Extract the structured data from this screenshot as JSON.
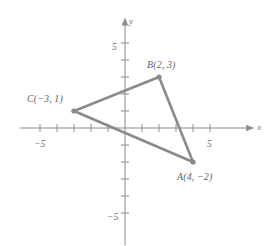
{
  "figure": {
    "width": 268,
    "height": 246,
    "background_color": "#ffffff"
  },
  "axes": {
    "x_axis_label": "x",
    "y_axis_label": "y",
    "axis_color": "#8c8c8c",
    "origin_px": {
      "x": 125,
      "y": 128
    },
    "unit_px": 17,
    "x_tick_labels": [
      {
        "text": "−5",
        "value": -5,
        "px_x": 40,
        "px_y": 140
      },
      {
        "text": "5",
        "value": 5,
        "px_x": 210,
        "px_y": 140
      }
    ],
    "y_tick_labels": [
      {
        "text": "5",
        "value": 5,
        "px_x": 112,
        "px_y": 43
      },
      {
        "text": "−5",
        "value": -5,
        "px_x": 107,
        "px_y": 213
      }
    ],
    "x_ticks": [
      -5,
      -4,
      -3,
      -2,
      -1,
      1,
      2,
      3,
      4,
      5
    ],
    "y_ticks": [
      -5,
      -4,
      -3,
      -2,
      -1,
      1,
      2,
      3,
      4,
      5
    ],
    "grid": false
  },
  "chart_data": {
    "type": "scatter",
    "title": "",
    "xlabel": "x",
    "ylabel": "y",
    "xlim": [
      -6.2,
      7.6
    ],
    "ylim": [
      -6.9,
      6.5
    ],
    "grid": false,
    "legend": null,
    "shape": {
      "name": "triangle ABC",
      "closed": true,
      "stroke_color": "#8a8a8a",
      "stroke_width": 2.6,
      "fill": "none"
    },
    "points": [
      {
        "name": "A",
        "label": "A(4, −2)",
        "x": 4,
        "y": -2,
        "px_x": 193,
        "px_y": 162,
        "label_px_x": 177,
        "label_px_y": 172,
        "marker": "filled-circle",
        "marker_color": "#8a8a8a"
      },
      {
        "name": "B",
        "label": "B(2, 3)",
        "x": 2,
        "y": 3,
        "px_x": 159,
        "px_y": 77,
        "label_px_x": 147,
        "label_px_y": 60,
        "marker": "filled-circle",
        "marker_color": "#8a8a8a"
      },
      {
        "name": "C",
        "label": "C(−3, 1)",
        "x": -3,
        "y": 1,
        "px_x": 74,
        "px_y": 111,
        "label_px_x": 27,
        "label_px_y": 94,
        "marker": "filled-circle",
        "marker_color": "#8a8a8a"
      }
    ],
    "edges": [
      {
        "from": "A",
        "to": "B"
      },
      {
        "from": "B",
        "to": "C"
      },
      {
        "from": "C",
        "to": "A"
      }
    ]
  }
}
